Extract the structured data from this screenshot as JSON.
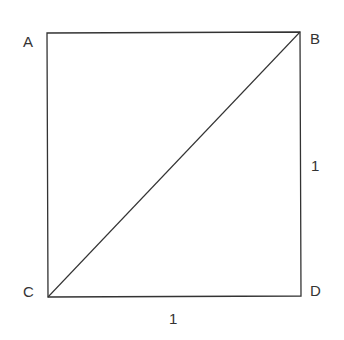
{
  "diagram": {
    "type": "geometry",
    "vertices": {
      "A": {
        "label": "A",
        "x": 47,
        "y": 33
      },
      "B": {
        "label": "B",
        "x": 300,
        "y": 32
      },
      "C": {
        "label": "C",
        "x": 48,
        "y": 297
      },
      "D": {
        "label": "D",
        "x": 301,
        "y": 296
      }
    },
    "edges": [
      {
        "from": "A",
        "to": "B"
      },
      {
        "from": "B",
        "to": "D"
      },
      {
        "from": "D",
        "to": "C"
      },
      {
        "from": "C",
        "to": "A"
      },
      {
        "from": "C",
        "to": "B",
        "role": "diagonal"
      }
    ],
    "side_labels": {
      "right": "1",
      "bottom": "1"
    },
    "line_color": "#333333"
  }
}
